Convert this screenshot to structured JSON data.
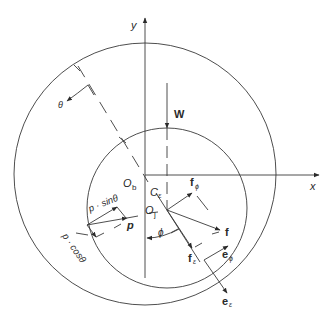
{
  "diagram": {
    "axes": {
      "x_label": "x",
      "y_label": "y"
    },
    "labels": {
      "bearing_center": "O",
      "bearing_center_sub": "b",
      "journal_center": "O",
      "journal_center_sub": "j",
      "eccentricity": "C",
      "eccentricity_sub": "ε",
      "load": "W",
      "angle_theta": "θ",
      "attitude_angle": "ϕ",
      "pressure": "p",
      "p_sin": "p · sinθ",
      "p_cos": "p · cosθ",
      "force": "f",
      "force_phi": "f",
      "force_phi_sub": "ϕ",
      "force_r": "f",
      "force_r_sub": "ε",
      "unit_phi": "e",
      "unit_phi_sub": "ϕ",
      "unit_r": "e",
      "unit_r_sub": "ε"
    },
    "geometry": {
      "outer_circle": {
        "cx": 145,
        "cy": 174,
        "r": 131
      },
      "inner_circle": {
        "cx": 167,
        "cy": 208,
        "r": 80
      },
      "journal_center": {
        "x": 167,
        "y": 210
      }
    },
    "colors": {
      "stroke": "#3a3a3a",
      "text": "#2a2a2a",
      "background": "#ffffff"
    }
  }
}
